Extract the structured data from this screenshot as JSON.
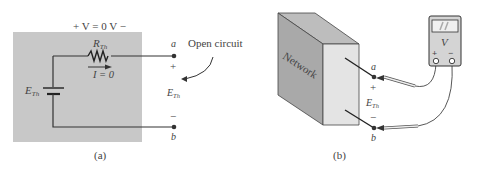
{
  "panel_a": {
    "caption": "(a)",
    "voltage_label": "+ V = 0 V −",
    "resistor_label": "R",
    "resistor_sub": "Th",
    "current_label": "I = 0",
    "source_label": "E",
    "source_sub": "Th",
    "terminal_a": "a",
    "terminal_b": "b",
    "plus": "+",
    "minus": "−",
    "open_circuit_label": "Open circuit",
    "eth_label": "E",
    "eth_sub": "Th",
    "box_color": "#c8c8c8"
  },
  "panel_b": {
    "caption": "(b)",
    "network_label": "Network",
    "meter_label": "V",
    "meter_plus": "+",
    "meter_minus": "−",
    "terminal_a": "a",
    "terminal_b": "b",
    "plus": "+",
    "minus": "−",
    "eth_label": "E",
    "eth_sub": "Th"
  }
}
